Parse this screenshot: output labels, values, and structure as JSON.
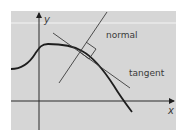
{
  "diagram": {
    "axes": {
      "x_label": "x",
      "y_label": "y"
    },
    "labels": {
      "normal": "normal",
      "tangent": "tangent"
    },
    "colors": {
      "background": "#d6d6d6",
      "band_line": "#f4f4f4",
      "curve": "#1e1e1e",
      "lines": "#3c3c3c",
      "text": "#3a3a3a"
    }
  }
}
